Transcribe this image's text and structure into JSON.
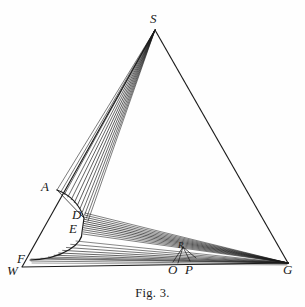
{
  "figure": {
    "caption": "Fig. 3.",
    "caption_x": 0,
    "caption_y": 286,
    "background_color": "#fefefe",
    "ink_color": "#1a1a1a",
    "width": 305,
    "height": 307
  },
  "labels": [
    {
      "text": "S",
      "x": 150,
      "y": 12,
      "name": "point-label-s",
      "size": "normal"
    },
    {
      "text": "A",
      "x": 41,
      "y": 180,
      "name": "point-label-a",
      "size": "normal"
    },
    {
      "text": "D",
      "x": 72,
      "y": 208,
      "name": "point-label-d",
      "size": "normal"
    },
    {
      "text": "E",
      "x": 69,
      "y": 222,
      "name": "point-label-e",
      "size": "normal"
    },
    {
      "text": "F",
      "x": 17,
      "y": 252,
      "name": "point-label-f",
      "size": "normal"
    },
    {
      "text": "W",
      "x": 7,
      "y": 264,
      "name": "point-label-w",
      "size": "normal"
    },
    {
      "text": "O",
      "x": 168,
      "y": 263,
      "name": "point-label-o",
      "size": "normal"
    },
    {
      "text": "P",
      "x": 185,
      "y": 263,
      "name": "point-label-p",
      "size": "normal"
    },
    {
      "text": "G",
      "x": 283,
      "y": 263,
      "name": "point-label-g",
      "size": "normal"
    },
    {
      "text": "R",
      "x": 178,
      "y": 241,
      "name": "point-label-r",
      "size": "small"
    }
  ],
  "chart_data": {
    "type": "diagram",
    "title": "Fig. 3.",
    "vertices": {
      "S": [
        155,
        30
      ],
      "W": [
        22,
        267
      ],
      "G": [
        288,
        263
      ],
      "A": [
        57,
        190
      ],
      "D": [
        84,
        218
      ],
      "E": [
        82,
        232
      ],
      "F": [
        30,
        260
      ],
      "O": [
        176,
        260
      ],
      "P": [
        192,
        261
      ],
      "R": [
        183,
        247
      ]
    },
    "triangle_outline": [
      [
        155,
        30
      ],
      [
        22,
        267
      ],
      [
        288,
        263
      ]
    ],
    "baseline": [
      [
        22,
        267
      ],
      [
        288,
        263
      ]
    ],
    "arc": {
      "from": "A",
      "through": [
        "D",
        "E"
      ],
      "to": "F",
      "control_points": [
        [
          100,
          222
        ],
        [
          96,
          250
        ]
      ]
    },
    "fan_s": {
      "apex": [
        155,
        30
      ],
      "target_start": [
        57,
        190
      ],
      "target_end": [
        88,
        221
      ],
      "ray_count": 12
    },
    "fan_g_upper": {
      "apex": [
        288,
        263
      ],
      "target_start": [
        85,
        213
      ],
      "target_end": [
        83,
        234
      ],
      "ray_count": 11
    },
    "fan_g_lower": {
      "apex": [
        288,
        263
      ],
      "target_start": [
        76,
        241
      ],
      "target_end": [
        31,
        259
      ],
      "ray_count": 9
    },
    "fan_r": {
      "apex": [
        183,
        247
      ],
      "spread": [
        [
          173,
          262
        ],
        [
          178,
          263
        ],
        [
          190,
          261
        ],
        [
          196,
          258
        ]
      ],
      "ray_count": 4
    }
  }
}
